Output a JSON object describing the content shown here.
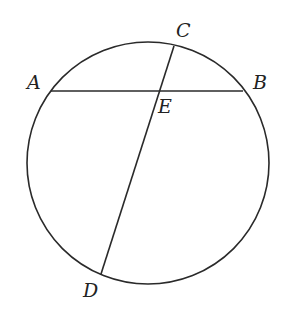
{
  "diagram": {
    "type": "circle-with-intersecting-chords",
    "circle": {
      "cx": 148,
      "cy": 163,
      "r": 121
    },
    "points": {
      "A": {
        "label": "A",
        "x": 51,
        "y": 91
      },
      "B": {
        "label": "B",
        "x": 244,
        "y": 91
      },
      "C": {
        "label": "C",
        "x": 174,
        "y": 46
      },
      "D": {
        "label": "D",
        "x": 101,
        "y": 274
      },
      "E": {
        "label": "E",
        "x": 161,
        "y": 91
      }
    },
    "chords": [
      {
        "name": "AB",
        "from": "A",
        "to": "B"
      },
      {
        "name": "CD",
        "from": "C",
        "to": "D"
      }
    ],
    "labels": {
      "A": "A",
      "B": "B",
      "C": "C",
      "D": "D",
      "E": "E"
    }
  }
}
